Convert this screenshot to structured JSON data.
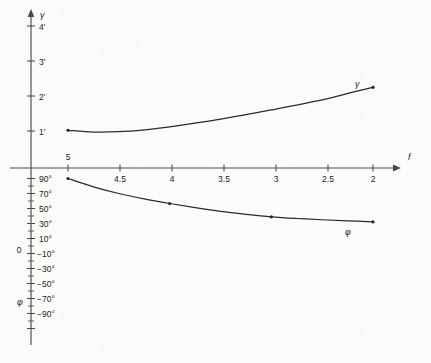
{
  "chart_data": {
    "type": "line",
    "title": "",
    "subtitle": "",
    "xlabel": "f",
    "ylabel_upper": "γ",
    "ylabel_lower": "φ",
    "grid": false,
    "legend": "inline-curve-labels",
    "x_axis": {
      "symbol": "f",
      "direction": "decreasing-left-to-right",
      "tick_labels": [
        "5",
        "4.5",
        "4",
        "3.5",
        "3",
        "2.5",
        "2"
      ],
      "tick_values": [
        5,
        4.5,
        4,
        3.5,
        3,
        2.5,
        2
      ],
      "xlim": [
        5,
        2
      ]
    },
    "y_axis_upper": {
      "symbol": "γ",
      "unit": "arcminutes",
      "tick_labels": [
        "1'",
        "2'",
        "3'",
        "4'"
      ],
      "tick_values": [
        1,
        2,
        3,
        4
      ],
      "ylim": [
        0,
        4.6
      ]
    },
    "y_axis_lower": {
      "symbol": "φ",
      "unit": "degrees",
      "zero_label": "0",
      "tick_labels": [
        "90°",
        "70°",
        "50°",
        "30°",
        "10°",
        "−10°",
        "−30°",
        "−50°",
        "−70°",
        "−90°"
      ],
      "tick_values": [
        90,
        70,
        50,
        30,
        10,
        -10,
        -30,
        -50,
        -70,
        -90
      ],
      "minor_tick_step": 10,
      "ylim": [
        90,
        -90
      ]
    },
    "series": [
      {
        "name": "γ",
        "label": "γ",
        "axis": "upper",
        "unit": "arcminutes",
        "x": [
          5.0,
          4.75,
          4.5,
          4.25,
          4.0,
          3.5,
          3.0,
          2.5,
          2.2,
          2.0
        ],
        "values": [
          1.02,
          0.97,
          0.98,
          1.03,
          1.11,
          1.32,
          1.57,
          1.84,
          2.05,
          2.18
        ],
        "markers_at_x": [
          5.0,
          2.0
        ]
      },
      {
        "name": "φ",
        "label": "φ",
        "axis": "lower",
        "unit": "degrees",
        "x": [
          5.0,
          4.75,
          4.5,
          4.25,
          4.0,
          3.75,
          3.5,
          3.25,
          3.0,
          2.75,
          2.5,
          2.25,
          2.0
        ],
        "values": [
          90.0,
          80.0,
          72.0,
          65.5,
          60.0,
          55.0,
          50.5,
          47.0,
          44.0,
          42.0,
          40.5,
          39.2,
          38.0
        ],
        "markers_at_x": [
          5.0,
          4.0,
          3.0,
          2.0
        ]
      }
    ]
  }
}
